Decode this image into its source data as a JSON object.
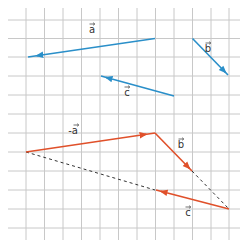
{
  "diagram": {
    "type": "vector-addition-grid",
    "grid": {
      "x_lines": [
        26,
        44.5,
        63,
        81.5,
        100,
        118.5,
        137,
        155.5,
        174,
        192.5,
        211,
        229
      ],
      "y_lines": [
        20,
        38.5,
        57,
        76,
        95,
        114,
        133,
        152,
        171,
        190,
        209,
        228
      ],
      "color": "#c8c8c8"
    },
    "colors": {
      "given_vectors": "#2a8fc9",
      "construction_vectors": "#e0502a",
      "dashed": "#333333"
    },
    "given_vectors": [
      {
        "name": "a",
        "label": "a",
        "from": [
          155,
          38.5
        ],
        "to": [
          28,
          57
        ],
        "label_pos": [
          92,
          33
        ]
      },
      {
        "name": "b",
        "label": "b",
        "from": [
          192.5,
          38.5
        ],
        "to": [
          228,
          75
        ],
        "label_pos": [
          208,
          52
        ]
      },
      {
        "name": "c",
        "label": "c",
        "from": [
          174,
          96
        ],
        "to": [
          101,
          76
        ],
        "label_pos": [
          127,
          96
        ]
      }
    ],
    "construction_vectors": [
      {
        "name": "minus-a",
        "label": "-a",
        "from": [
          26,
          152
        ],
        "to": [
          155,
          133
        ],
        "label_pos": [
          73,
          134
        ]
      },
      {
        "name": "b",
        "label": "b",
        "from": [
          155,
          133
        ],
        "to": [
          192,
          171
        ],
        "label_pos": [
          181,
          148
        ]
      },
      {
        "name": "c",
        "label": "c",
        "from": [
          229,
          209
        ],
        "to": [
          156,
          190
        ],
        "label_pos": [
          188,
          216
        ]
      }
    ],
    "dashed_lines": [
      {
        "from": [
          26,
          152
        ],
        "to": [
          155,
          190
        ]
      },
      {
        "from": [
          192,
          171
        ],
        "to": [
          229,
          209
        ]
      }
    ]
  }
}
